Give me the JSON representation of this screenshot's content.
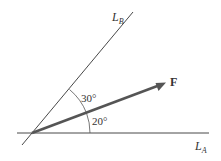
{
  "diagram": {
    "type": "force-vector-components",
    "lines": {
      "line_a": {
        "label_main": "L",
        "label_sub": "A",
        "angle_deg": 0
      },
      "line_b": {
        "label_main": "L",
        "label_sub": "B",
        "angle_deg": 50
      }
    },
    "force": {
      "label": "F",
      "angle_from_line_a_deg": 20
    },
    "angles": {
      "between_force_and_line_b": "30°",
      "between_force_and_line_a": "20°"
    },
    "colors": {
      "line": "#333333",
      "force_arrow": "#555555",
      "text": "#333333",
      "background": "#ffffff"
    }
  }
}
